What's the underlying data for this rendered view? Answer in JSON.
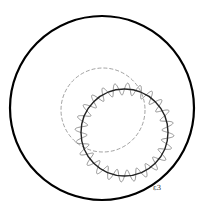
{
  "diagram": {
    "width": 204,
    "height": 209,
    "outer_circle": {
      "cx": 102,
      "cy": 108,
      "r": 92,
      "stroke": "#000000",
      "stroke_width": 2.2
    },
    "dashed_circle": {
      "cx": 103,
      "cy": 110,
      "r": 42,
      "stroke": "#8a8a8a",
      "stroke_width": 0.8,
      "dash": "4 2"
    },
    "inner_circle": {
      "cx": 124.5,
      "cy": 132.5,
      "r": 43.5,
      "stroke": "#222222",
      "stroke_width": 1.4
    },
    "wave_curve": {
      "cx": 124.5,
      "cy": 132.5,
      "r": 43.5,
      "amplitude": 6,
      "oscillations": 24,
      "stroke": "#7a7a7a",
      "stroke_width": 0.8
    },
    "label": {
      "text": "ε3",
      "x": 153,
      "y": 190
    }
  }
}
